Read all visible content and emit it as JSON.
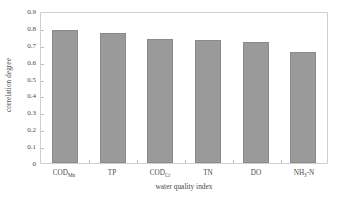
{
  "chart_data": {
    "type": "bar",
    "title": "",
    "xlabel": "water quality index",
    "ylabel": "correlation degree",
    "categories": [
      "CODMn",
      "TP",
      "CODCr",
      "TN",
      "DO",
      "NH3-N"
    ],
    "category_labels": [
      {
        "base": "COD",
        "sub": "Mn"
      },
      {
        "base": "TP",
        "sub": ""
      },
      {
        "base": "COD",
        "sub": "Cr"
      },
      {
        "base": "TN",
        "sub": ""
      },
      {
        "base": "DO",
        "sub": ""
      },
      {
        "base": "NH",
        "sub": "3",
        "tail": "-N"
      }
    ],
    "values": [
      0.79,
      0.77,
      0.735,
      0.73,
      0.715,
      0.66
    ],
    "ylim": [
      0,
      0.9
    ],
    "yticks": [
      0,
      0.1,
      0.2,
      0.3,
      0.4,
      0.5,
      0.6,
      0.7,
      0.8,
      0.9
    ],
    "ytick_labels": [
      "0",
      "0.1",
      "0.2",
      "0.3",
      "0.4",
      "0.5",
      "0.6",
      "0.7",
      "0.8",
      "0.9"
    ],
    "grid": false,
    "legend": null,
    "bar_color": "#9a9a9a",
    "bar_edge_color": "#8a8a8a",
    "frame_color": "#cfcfcf",
    "text_color": "#4a4a4a"
  }
}
